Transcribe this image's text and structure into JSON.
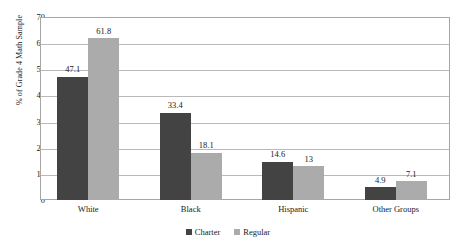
{
  "chart_data": {
    "type": "bar",
    "title": "",
    "subtitle": "",
    "xlabel": "",
    "ylabel": "% of Grade 4 Math Sample",
    "categories": [
      "White",
      "Black",
      "Hispanic",
      "Other Groups"
    ],
    "series": [
      {
        "name": "Charter",
        "color": "#434343",
        "values": [
          47.1,
          33.4,
          14.6,
          4.9
        ],
        "labels": [
          "47.1",
          "33.4",
          "14.6",
          "4.9"
        ]
      },
      {
        "name": "Regular",
        "color": "#ababab",
        "values": [
          61.8,
          18.1,
          13,
          7.1
        ],
        "labels": [
          "61.8",
          "18.1",
          "13",
          "7.1"
        ]
      }
    ],
    "ylim": [
      0,
      70
    ],
    "ytick_step": 10,
    "ytick_labels": [
      "70",
      "60",
      "50",
      "40",
      "30",
      "20",
      "10",
      "0"
    ],
    "grid": "horizontal",
    "legend_position": "bottom-center",
    "plot_border_color": "#a6a6a6",
    "gridline_color": "#b9b9b9",
    "background_color": "#ffffff",
    "text_color": "#1a1a1a"
  },
  "legend": {
    "items": [
      {
        "label": "Charter",
        "color": "#434343",
        "swatch_icon": "square-icon"
      },
      {
        "label": "Regular",
        "color": "#ababab",
        "swatch_icon": "square-icon"
      }
    ]
  }
}
